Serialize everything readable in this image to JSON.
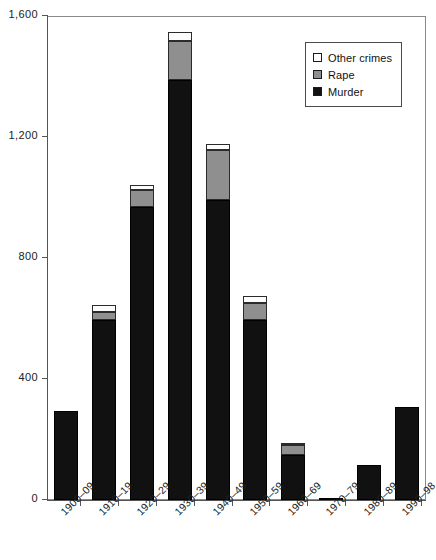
{
  "chart_data": {
    "type": "bar",
    "stacked": true,
    "title": "",
    "subtitle": "",
    "xlabel": "",
    "ylabel": "",
    "categories": [
      "1900–09",
      "1910–19",
      "1920–29",
      "1930–39",
      "1940–49",
      "1950–59",
      "1960–69",
      "1970–79",
      "1980–89",
      "1990–98"
    ],
    "series": [
      {
        "name": "Murder",
        "color": "#111111",
        "values": [
          294,
          595,
          968,
          1388,
          992,
          595,
          149,
          3,
          115,
          307
        ]
      },
      {
        "name": "Rape",
        "color": "#8f8f8f",
        "values": [
          0,
          26,
          56,
          129,
          165,
          56,
          33,
          0,
          0,
          0
        ]
      },
      {
        "name": "Other crimes",
        "color": "#ffffff",
        "values": [
          0,
          24,
          17,
          30,
          20,
          24,
          6,
          0,
          0,
          0
        ]
      }
    ],
    "totals": [
      294,
      645,
      1041,
      1547,
      1177,
      675,
      188,
      3,
      115,
      307
    ],
    "ylim": [
      0,
      1600
    ],
    "yticks": [
      0,
      400,
      800,
      1200,
      1600
    ],
    "ytick_labels": [
      "0",
      "400",
      "800",
      "1,200",
      "1,600"
    ],
    "grid": false,
    "legend_position": "top-right",
    "legend_entries": [
      "Other crimes",
      "Rape",
      "Murder"
    ]
  },
  "legend": {
    "items": [
      {
        "label": "Other crimes",
        "swatch": "other-crimes-swatch"
      },
      {
        "label": "Rape",
        "swatch": "rape-swatch"
      },
      {
        "label": "Murder",
        "swatch": "murder-swatch"
      }
    ]
  }
}
